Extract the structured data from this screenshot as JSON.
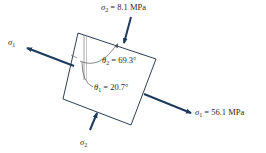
{
  "diagram": {
    "type": "principal-stress-element",
    "colors": {
      "arrow": "#1f3a5f",
      "element_outline": "#2f3f55",
      "annotation": "#555555",
      "text": "#2a2a2a"
    },
    "labels": {
      "sigma2_top": {
        "symbol": "σ",
        "sub": "2",
        "rest": " = 8.1 MPa"
      },
      "sigma1_left": {
        "symbol": "σ",
        "sub": "1",
        "rest": ""
      },
      "sigma1_right": {
        "symbol": "σ",
        "sub": "1",
        "rest": " = 56.1 MPa"
      },
      "sigma2_bottom": {
        "symbol": "σ",
        "sub": "2",
        "rest": ""
      },
      "theta2": {
        "symbol": "θ",
        "sub": "2",
        "rest": " = 69.3°"
      },
      "theta1": {
        "symbol": "θ",
        "sub": "1",
        "rest": " = 20.7°"
      }
    },
    "values": {
      "sigma1_MPa": 56.1,
      "sigma2_MPa": 8.1,
      "theta1_deg": 20.7,
      "theta2_deg": 69.3
    }
  }
}
